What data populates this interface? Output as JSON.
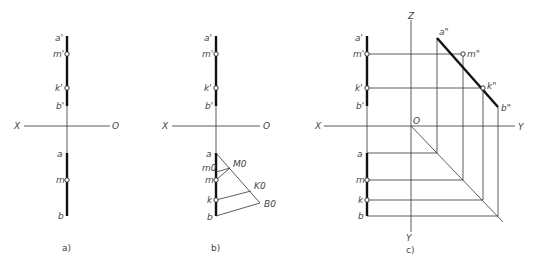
{
  "figure": {
    "panels": [
      {
        "id": "a",
        "caption": "a)",
        "axis_labels": {
          "x": "X",
          "o": "O"
        },
        "front_view": {
          "a": "a'",
          "m": "m'",
          "k": "k'",
          "b": "b'"
        },
        "top_view": {
          "a": "a",
          "m": "m",
          "b": "b"
        }
      },
      {
        "id": "b",
        "caption": "b)",
        "axis_labels": {
          "x": "X",
          "o": "O"
        },
        "front_view": {
          "a": "a'",
          "m": "m'",
          "k": "k'",
          "b": "b'"
        },
        "top_view": {
          "a": "a",
          "m0": "m0",
          "m": "m",
          "k": "k",
          "b": "b"
        },
        "construction": {
          "M0": "M0",
          "K0": "K0",
          "B0": "B0"
        }
      },
      {
        "id": "c",
        "caption": "c)",
        "axis_labels": {
          "x": "X",
          "o": "O",
          "z": "Z",
          "y_h": "Y",
          "y_v": "Y"
        },
        "front_view": {
          "a": "a'",
          "m": "m'",
          "k": "k'",
          "b": "b'"
        },
        "top_view": {
          "a": "a",
          "m": "m",
          "k": "k",
          "b": "b"
        },
        "side_view": {
          "a": "a\"",
          "m": "m\"",
          "k": "k\"",
          "b": "b\""
        }
      }
    ]
  }
}
